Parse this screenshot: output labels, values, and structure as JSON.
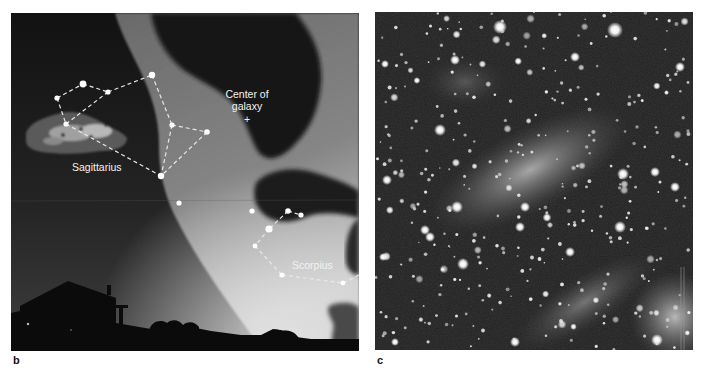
{
  "figure": {
    "panels": [
      {
        "id": "b",
        "label": "b",
        "description": "Illustration of night sky looking toward the center of the Milky Way above a house silhouette",
        "annotations": {
          "center_line1": "Center of",
          "center_line2": "galaxy",
          "center_marker": "+",
          "sagittarius": "Sagittarius",
          "scorpius": "Scorpius"
        },
        "constellations": [
          {
            "name": "Sagittarius",
            "stars": [
              [
                46,
                85
              ],
              [
                72,
                71
              ],
              [
                97,
                79
              ],
              [
                141,
                62
              ],
              [
                55,
                111
              ],
              [
                161,
                112
              ],
              [
                196,
                119
              ],
              [
                150,
                163
              ]
            ],
            "lines": [
              [
                0,
                1
              ],
              [
                1,
                2
              ],
              [
                2,
                3
              ],
              [
                0,
                4
              ],
              [
                4,
                2
              ],
              [
                4,
                7
              ],
              [
                3,
                5
              ],
              [
                5,
                7
              ],
              [
                5,
                6
              ],
              [
                6,
                7
              ]
            ]
          },
          {
            "name": "Scorpius",
            "stars": [
              [
                241,
                198
              ],
              [
                277,
                198
              ],
              [
                290,
                202
              ],
              [
                258,
                216
              ],
              [
                244,
                233
              ],
              [
                271,
                262
              ],
              [
                332,
                270
              ],
              [
                348,
                264
              ]
            ],
            "lines": [
              [
                1,
                2
              ],
              [
                1,
                3
              ],
              [
                3,
                4
              ],
              [
                4,
                5
              ],
              [
                5,
                6
              ],
              [
                6,
                7
              ]
            ]
          }
        ],
        "isolated_stars": [
          [
            168,
            190
          ],
          [
            241,
            198
          ]
        ]
      },
      {
        "id": "c",
        "label": "c",
        "description": "Photograph of dense star field toward galactic center with diffuse glow"
      }
    ],
    "colors": {
      "sky_dark": "#141414",
      "sky_horizon": "#3c3c3c",
      "milky_way": "#7a7a7a",
      "milky_way_bright": "#b8b8b8",
      "dust_cloud": "#161616",
      "star": "#ffffff",
      "silhouette": "#0a0a0a"
    }
  }
}
